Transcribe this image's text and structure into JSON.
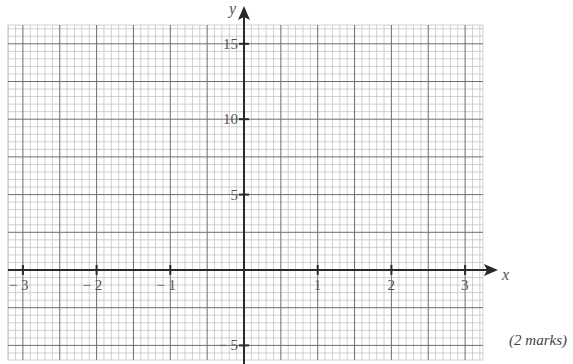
{
  "chart_data": {
    "type": "scatter",
    "title": "",
    "xlabel": "x",
    "ylabel": "y",
    "xlim": [
      -3.2,
      3.25
    ],
    "ylim": [
      -6.0,
      16.2
    ],
    "x_ticks": [
      -3,
      -2,
      -1,
      1,
      2,
      3
    ],
    "y_ticks": [
      -5,
      5,
      10,
      15
    ],
    "x_tick_labels": [
      "− 3",
      "− 2",
      "− 1",
      "1",
      "2",
      "3"
    ],
    "y_tick_labels": [
      "− 5",
      "5",
      "10",
      "15"
    ],
    "grid": true,
    "series": []
  },
  "axes": {
    "x_label": "x",
    "y_label": "y"
  },
  "marks_label": "(2 marks)",
  "colors": {
    "minor_grid": "#bdbdbd",
    "major_grid": "#6e6e6e",
    "axis": "#2a2a2a",
    "label": "#555555"
  }
}
